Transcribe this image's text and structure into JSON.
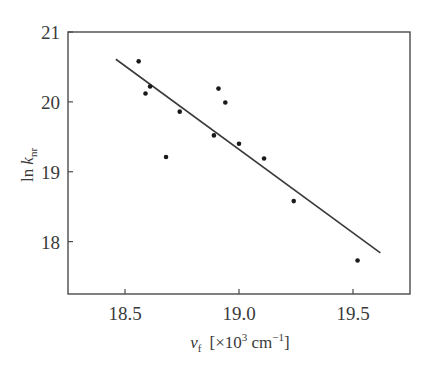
{
  "chart_data": {
    "type": "scatter",
    "title": "",
    "xlabel": "ν_f [×10³ cm⁻¹]",
    "ylabel": "ln k_nr",
    "xlabel_parts": {
      "symbol": "ν",
      "sub": "f",
      "unit_pre": "[×10",
      "unit_exp": "3",
      "unit_mid": " cm",
      "unit_exp2": "−1",
      "unit_post": "]"
    },
    "ylabel_parts": {
      "prefix": "ln ",
      "symbol": "k",
      "sub": "nr"
    },
    "xlim": [
      18.25,
      19.75
    ],
    "ylim": [
      17.25,
      21.0
    ],
    "xticks": [
      18.5,
      19.0,
      19.5
    ],
    "xtick_labels": [
      "18.5",
      "19.0",
      "19.5"
    ],
    "yticks": [
      18,
      19,
      20,
      21
    ],
    "ytick_labels": [
      "18",
      "19",
      "20",
      "21"
    ],
    "grid": false,
    "legend": null,
    "series": [
      {
        "name": "data",
        "kind": "points",
        "x": [
          18.56,
          18.59,
          18.61,
          18.68,
          18.74,
          18.89,
          18.91,
          18.94,
          19.0,
          19.11,
          19.24,
          19.52
        ],
        "y": [
          20.58,
          20.12,
          20.22,
          19.21,
          19.86,
          19.52,
          20.19,
          19.99,
          19.4,
          19.19,
          18.58,
          17.73
        ]
      },
      {
        "name": "linear fit",
        "kind": "line",
        "x": [
          18.46,
          19.62
        ],
        "y": [
          20.61,
          17.84
        ]
      }
    ]
  },
  "colors": {
    "axis": "#4a4a4a",
    "line": "#3a3a3a",
    "points": "#1a1a1a"
  }
}
